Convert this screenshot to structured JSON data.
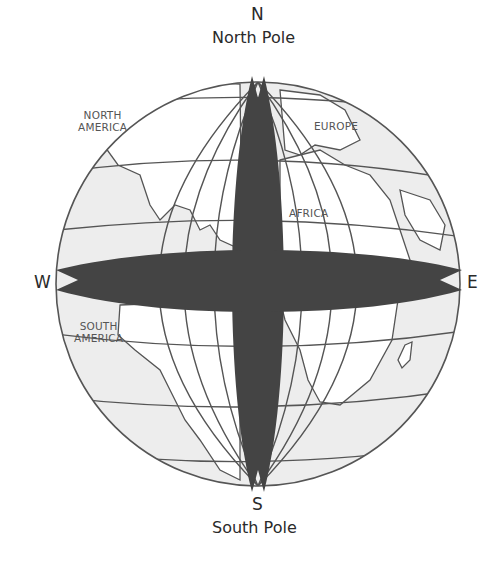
{
  "directions": {
    "north": "N",
    "south": "S",
    "west": "W",
    "east": "E"
  },
  "poles": {
    "north": "North Pole",
    "south": "South Pole"
  },
  "continents": {
    "north_america_1": "NORTH",
    "north_america_2": "AMERICA",
    "europe": "EUROPE",
    "africa": "AFRICA",
    "south_america_1": "SOUTH",
    "south_america_2": "AMERICA"
  },
  "colors": {
    "ocean": "#eeeeee",
    "land": "#ffffff",
    "grid": "#555555",
    "band": "#444444"
  }
}
